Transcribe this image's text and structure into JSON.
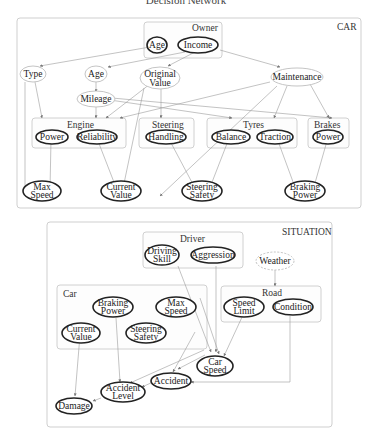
{
  "title": "Decision Network",
  "groups": {
    "car": {
      "label": "CAR"
    },
    "owner": {
      "label": "Owner"
    },
    "engine": {
      "label": "Engine"
    },
    "steering": {
      "label": "Steering"
    },
    "tyres": {
      "label": "Tyres"
    },
    "brakes": {
      "label": "Brakes"
    },
    "situation": {
      "label": "SITUATION"
    },
    "driver": {
      "label": "Driver"
    },
    "sit_car": {
      "label": "Car"
    },
    "road": {
      "label": "Road"
    }
  },
  "nodes": {
    "owner_age": "Age",
    "owner_income": "Income",
    "type": "Type",
    "age": "Age",
    "original_value": [
      "Original",
      "Value"
    ],
    "maintenance": "Maintenance",
    "mileage": "Mileage",
    "engine_power": "Power",
    "engine_reliability": "Reliability",
    "steering_handling": "Handling",
    "tyres_balance": "Balance",
    "tyres_traction": "Traction",
    "brakes_power": "Power",
    "max_speed": [
      "Max",
      "Speed"
    ],
    "current_value": [
      "Current",
      "Value"
    ],
    "steering_safety": [
      "Steering",
      "Safety"
    ],
    "braking_power": [
      "Braking",
      "Power"
    ],
    "driving_skill": [
      "Driving",
      "Skill"
    ],
    "aggression": "Aggression",
    "weather": "Weather",
    "sit_braking_power": [
      "Braking",
      "Power"
    ],
    "sit_max_speed": [
      "Max",
      "Speed"
    ],
    "sit_current_value": [
      "Current",
      "Value"
    ],
    "sit_steering_safety": [
      "Steering",
      "Safety"
    ],
    "speed_limit": [
      "Speed",
      "Limit"
    ],
    "condition": "Condition",
    "car_speed": [
      "Car",
      "Speed"
    ],
    "accident": "Accident",
    "accident_level": [
      "Accident",
      "Level"
    ],
    "damage": "Damage"
  },
  "node_styles": {
    "thick": [
      "owner_age",
      "owner_income",
      "engine_power",
      "engine_reliability",
      "steering_handling",
      "tyres_balance",
      "tyres_traction",
      "brakes_power",
      "max_speed",
      "current_value",
      "steering_safety",
      "braking_power",
      "driving_skill",
      "aggression",
      "sit_braking_power",
      "sit_max_speed",
      "sit_current_value",
      "sit_steering_safety",
      "speed_limit",
      "condition",
      "car_speed",
      "accident",
      "accident_level",
      "damage"
    ],
    "thin": [
      "type",
      "age",
      "original_value",
      "maintenance",
      "mileage"
    ],
    "dotted": [
      "weather"
    ]
  },
  "edges": [
    [
      "owner_age",
      "type"
    ],
    [
      "owner_income",
      "age"
    ],
    [
      "owner_income",
      "original_value"
    ],
    [
      "owner_income",
      "maintenance"
    ],
    [
      "age",
      "mileage"
    ],
    [
      "type",
      "engine"
    ],
    [
      "type",
      "max_speed"
    ],
    [
      "mileage",
      "engine"
    ],
    [
      "mileage",
      "tyres"
    ],
    [
      "mileage",
      "brakes"
    ],
    [
      "original_value",
      "engine"
    ],
    [
      "original_value",
      "steering"
    ],
    [
      "original_value",
      "current_value"
    ],
    [
      "maintenance",
      "engine"
    ],
    [
      "maintenance",
      "tyres"
    ],
    [
      "maintenance",
      "brakes"
    ],
    [
      "maintenance",
      "current_value"
    ],
    [
      "engine_power",
      "max_speed"
    ],
    [
      "engine_reliability",
      "current_value"
    ],
    [
      "steering_handling",
      "steering_safety"
    ],
    [
      "tyres_balance",
      "steering_safety"
    ],
    [
      "tyres_traction",
      "braking_power"
    ],
    [
      "brakes_power",
      "braking_power"
    ],
    [
      "weather",
      "road"
    ],
    [
      "driving_skill",
      "car_speed"
    ],
    [
      "aggression",
      "car_speed"
    ],
    [
      "sit_max_speed",
      "car_speed"
    ],
    [
      "speed_limit",
      "car_speed"
    ],
    [
      "condition",
      "accident"
    ],
    [
      "car_speed",
      "accident"
    ],
    [
      "sit_steering_safety",
      "accident"
    ],
    [
      "sit_braking_power",
      "accident_level"
    ],
    [
      "accident",
      "accident_level"
    ],
    [
      "car_speed",
      "accident_level"
    ],
    [
      "sit_current_value",
      "damage"
    ],
    [
      "accident_level",
      "damage"
    ]
  ]
}
